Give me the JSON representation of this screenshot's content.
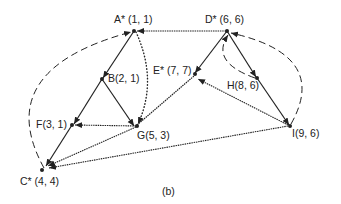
{
  "figure": {
    "caption": "(b)",
    "colors": {
      "ink": "#222222",
      "background": "#ffffff"
    },
    "nodes": [
      {
        "id": "A",
        "name": "A",
        "star": true,
        "coords": "(1, 1)",
        "label": "A* (1, 1)"
      },
      {
        "id": "B",
        "name": "B",
        "star": false,
        "coords": "(2, 1)",
        "label": "B(2, 1)"
      },
      {
        "id": "C",
        "name": "C",
        "star": true,
        "coords": "(4, 4)",
        "label": "C* (4, 4)"
      },
      {
        "id": "D",
        "name": "D",
        "star": true,
        "coords": "(6, 6)",
        "label": "D* (6, 6)"
      },
      {
        "id": "E",
        "name": "E",
        "star": true,
        "coords": "(7, 7)",
        "label": "E* (7, 7)"
      },
      {
        "id": "F",
        "name": "F",
        "star": false,
        "coords": "(3, 1)",
        "label": "F(3, 1)"
      },
      {
        "id": "G",
        "name": "G",
        "star": false,
        "coords": "(5, 3)",
        "label": "G(5, 3)"
      },
      {
        "id": "H",
        "name": "H",
        "star": false,
        "coords": "(8, 6)",
        "label": "H(8, 6)"
      },
      {
        "id": "I",
        "name": "I",
        "star": false,
        "coords": "(9, 6)",
        "label": "I(9, 6)"
      }
    ],
    "edges": [
      {
        "from": "A",
        "to": "B",
        "style": "solid"
      },
      {
        "from": "B",
        "to": "F",
        "style": "solid"
      },
      {
        "from": "B",
        "to": "G",
        "style": "solid"
      },
      {
        "from": "F",
        "to": "C",
        "style": "solid"
      },
      {
        "from": "D",
        "to": "E",
        "style": "solid"
      },
      {
        "from": "D",
        "to": "H",
        "style": "solid"
      },
      {
        "from": "H",
        "to": "I",
        "style": "solid"
      },
      {
        "from": "D",
        "to": "A",
        "style": "wavy"
      },
      {
        "from": "G",
        "to": "F",
        "style": "wavy"
      },
      {
        "from": "G",
        "to": "C",
        "style": "wavy"
      },
      {
        "from": "I",
        "to": "C",
        "style": "wavy"
      },
      {
        "from": "I",
        "to": "E",
        "style": "wavy"
      },
      {
        "from": "G",
        "to": "E",
        "style": "wavy"
      },
      {
        "from": "A",
        "to": "G",
        "style": "dotted"
      },
      {
        "from": "C",
        "to": "A",
        "style": "dashed"
      },
      {
        "from": "I",
        "to": "D",
        "style": "dashed"
      },
      {
        "from": "H",
        "to": "D",
        "style": "dashed"
      }
    ]
  }
}
